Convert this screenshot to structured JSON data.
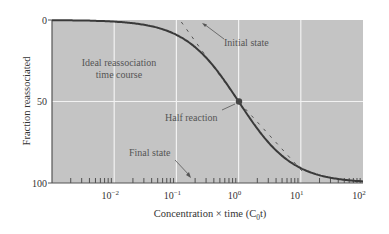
{
  "chart_data": {
    "type": "line",
    "title": "",
    "xlabel": "Concentration × time (C0t)",
    "xlabel_main": "Concentration × time (C",
    "xlabel_sub": "0",
    "xlabel_end": "t)",
    "ylabel": "Fraction reassociated",
    "xscale": "log",
    "xlim": [
      0.001,
      100
    ],
    "ylim": [
      0,
      100
    ],
    "y_inverted": true,
    "x_ticks": [
      {
        "base": "10",
        "exp": "−2",
        "value": 0.01
      },
      {
        "base": "10",
        "exp": "−1",
        "value": 0.1
      },
      {
        "base": "10",
        "exp": "0",
        "value": 1
      },
      {
        "base": "10",
        "exp": "1",
        "value": 10
      },
      {
        "base": "10",
        "exp": "2",
        "value": 100
      }
    ],
    "y_ticks": [
      "0",
      "50",
      "100"
    ],
    "grid": true,
    "series": [
      {
        "name": "Ideal reassociation time course",
        "x": [
          0.001,
          0.01,
          0.03,
          0.1,
          0.2,
          0.5,
          1,
          2,
          5,
          10,
          20,
          50,
          100
        ],
        "values": [
          0.1,
          1,
          3,
          9,
          17,
          33,
          50,
          67,
          83,
          91,
          95,
          98,
          99
        ]
      }
    ],
    "annotations": [
      {
        "text": "Initial state",
        "x": 0.12,
        "y": 0
      },
      {
        "text": "Ideal reassociation time course",
        "line1": "Ideal reassociation",
        "line2": "time course"
      },
      {
        "text": "Half reaction",
        "x": 1,
        "y": 50
      },
      {
        "text": "Final state",
        "x": 0.2,
        "y": 100
      }
    ],
    "colors": {
      "plot_bg": "#c4c4c4",
      "curve": "#3a3a3a",
      "grid": "#f2f2f2",
      "dashed": "#555555"
    }
  }
}
